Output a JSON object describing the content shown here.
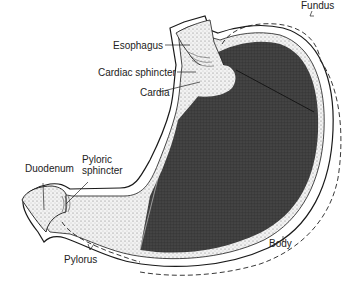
{
  "colors": {
    "background": "#ffffff",
    "outline": "#1a1a1a",
    "body_fill": "#3a3a3a",
    "light_fill": "#ececec",
    "text": "#222222"
  },
  "labels": {
    "esophagus": "Esophagus",
    "cardiac_sphincter": "Cardiac sphincter",
    "cardia": "Cardia",
    "fundus": "Fundus",
    "duodenum": "Duodenum",
    "pyloric_sphincter_line1": "Pyloric",
    "pyloric_sphincter_line2": "sphincter",
    "pylorus": "Pylorus",
    "body": "Body"
  }
}
